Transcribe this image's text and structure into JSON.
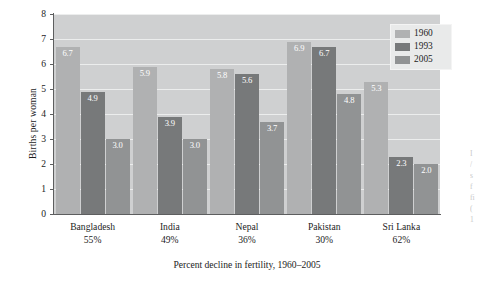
{
  "chart_data": {
    "type": "bar",
    "title": "",
    "xlabel": "Percent decline in fertility,  1960–2005",
    "ylabel": "Births per woman",
    "ylim": [
      0,
      8
    ],
    "yticks": [
      0,
      1,
      2,
      3,
      4,
      5,
      6,
      7,
      8
    ],
    "grid": true,
    "legend_position": "top-right",
    "categories": [
      "Bangladesh",
      "India",
      "Nepal",
      "Pakistan",
      "Sri Lanka"
    ],
    "category_sublabels": [
      "55%",
      "49%",
      "36%",
      "30%",
      "62%"
    ],
    "series": [
      {
        "name": "1960",
        "color": "#b0b1b2",
        "values": [
          6.7,
          5.9,
          5.8,
          6.9,
          5.3
        ]
      },
      {
        "name": "1993",
        "color": "#77797a",
        "values": [
          4.9,
          3.9,
          5.6,
          6.7,
          2.3
        ]
      },
      {
        "name": "2005",
        "color": "#919394",
        "values": [
          3.0,
          3.0,
          3.7,
          4.8,
          2.0
        ]
      }
    ],
    "value_labels": [
      [
        "6.7",
        "4.9",
        "3.0"
      ],
      [
        "5.9",
        "3.9",
        "3.0"
      ],
      [
        "5.8",
        "5.6",
        "3.7"
      ],
      [
        "6.9",
        "6.7",
        "4.8"
      ],
      [
        "5.3",
        "2.3",
        "2.0"
      ]
    ]
  },
  "legend": {
    "items": [
      {
        "label": "1960"
      },
      {
        "label": "1993"
      },
      {
        "label": "2005"
      }
    ]
  },
  "margin_bleed": {
    "lines": [
      "I",
      "/",
      "s",
      "f",
      "fi",
      "(",
      "1"
    ]
  }
}
